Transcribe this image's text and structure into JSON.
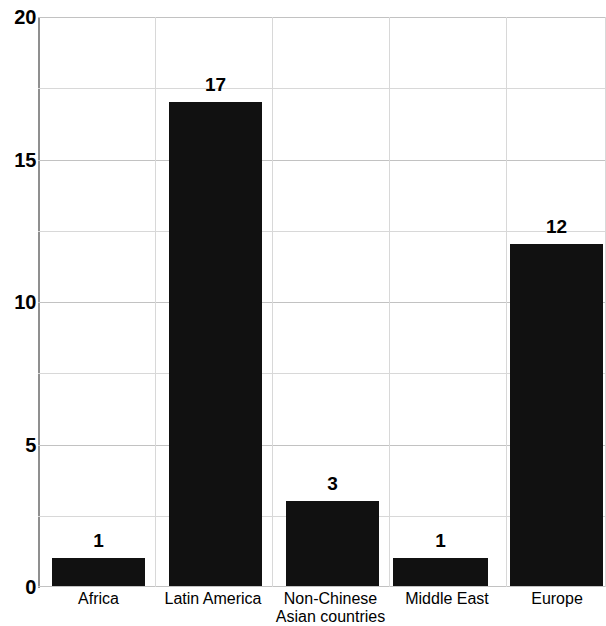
{
  "chart_data": {
    "type": "bar",
    "title": "",
    "subtitle": "",
    "xlabel": "",
    "ylabel": "",
    "categories": [
      "Africa",
      "Latin America",
      "Non-Chinese Asian countries",
      "Middle East",
      "Europe"
    ],
    "category_lines": [
      [
        "Africa"
      ],
      [
        "Latin America"
      ],
      [
        "Non-Chinese",
        "Asian countries"
      ],
      [
        "Middle East"
      ],
      [
        "Europe"
      ]
    ],
    "values": [
      1,
      17,
      3,
      1,
      12
    ],
    "data_labels": [
      "1",
      "17",
      "3",
      "1",
      "12"
    ],
    "ylim": [
      0,
      20
    ],
    "ytick_labels": [
      "0",
      "5",
      "10",
      "15",
      "20"
    ],
    "ytick_values": [
      0,
      5,
      10,
      15,
      20
    ],
    "minor_gridline_values": [
      2.5,
      7.5,
      12.5,
      17.5
    ],
    "grid": true,
    "legend": "none",
    "bar_color": "#111111",
    "gridline_color": "#d8d8d8",
    "axis_color": "#8f8f8f",
    "background_color": "#ffffff"
  }
}
